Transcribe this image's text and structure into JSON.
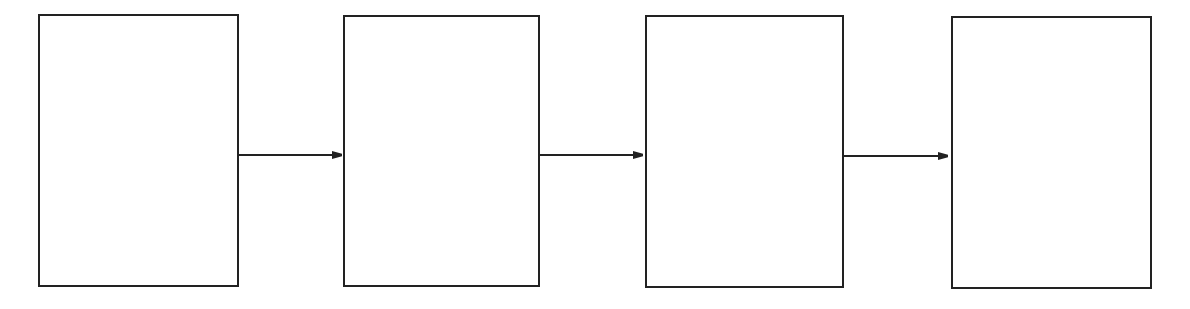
{
  "diagram": {
    "type": "linear-flow",
    "stroke_color": "#222222",
    "background": "#ffffff",
    "boxes": [
      {
        "id": "box-1",
        "label": "",
        "x": 39,
        "y": 15,
        "w": 199,
        "h": 271
      },
      {
        "id": "box-2",
        "label": "",
        "x": 344,
        "y": 16,
        "w": 195,
        "h": 270
      },
      {
        "id": "box-3",
        "label": "",
        "x": 646,
        "y": 16,
        "w": 197,
        "h": 271
      },
      {
        "id": "box-4",
        "label": "",
        "x": 952,
        "y": 17,
        "w": 199,
        "h": 271
      }
    ],
    "arrows": [
      {
        "from": "box-1",
        "to": "box-2",
        "x1": 238,
        "x2": 342,
        "y": 155
      },
      {
        "from": "box-2",
        "to": "box-3",
        "x1": 539,
        "x2": 643,
        "y": 155
      },
      {
        "from": "box-3",
        "to": "box-4",
        "x1": 843,
        "x2": 948,
        "y": 156
      }
    ]
  }
}
